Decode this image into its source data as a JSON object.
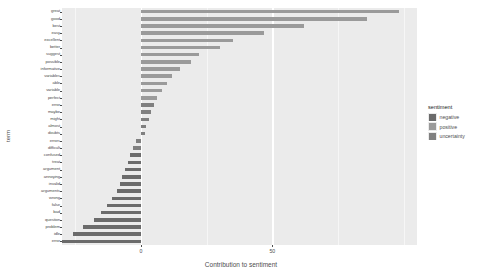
{
  "chart_data": {
    "type": "bar",
    "orientation": "horizontal",
    "title": "",
    "xlabel": "Contribution to sentiment",
    "ylabel": "term",
    "xlim": [
      -30,
      105
    ],
    "xticks": [
      0,
      50
    ],
    "xticklabels": [
      "0",
      "50"
    ],
    "grid": true,
    "legend": {
      "title": "sentiment",
      "position": "right",
      "entries": [
        {
          "label": "negative",
          "color": "#6b6b6b"
        },
        {
          "label": "positive",
          "color": "#9a9a9a"
        },
        {
          "label": "uncertainty",
          "color": "#808080"
        }
      ]
    },
    "categories": [
      "great",
      "good",
      "best",
      "easy",
      "excellent",
      "better",
      "suggest",
      "possible",
      "informative",
      "variables",
      "able",
      "variable",
      "perfect",
      "error",
      "maybe",
      "might",
      "almost",
      "doubts",
      "errors",
      "difficult",
      "confused",
      "treat",
      "argument",
      "annoying",
      "invalid",
      "arguments",
      "wrong",
      "false",
      "bad",
      "question",
      "problem",
      "idle",
      "error "
    ],
    "values": [
      98,
      86,
      62,
      47,
      35,
      30,
      22,
      19,
      15,
      12,
      10,
      8,
      6,
      5,
      4,
      3,
      2,
      1.5,
      -2,
      -3,
      -4,
      -5,
      -6,
      -7,
      -8,
      -9,
      -11,
      -13,
      -15,
      -18,
      -22,
      -26,
      -32
    ],
    "series": [
      {
        "name": "positive",
        "color": "#9a9a9a",
        "points": [
          {
            "term": "great",
            "value": 98
          },
          {
            "term": "good",
            "value": 86
          },
          {
            "term": "best",
            "value": 62
          },
          {
            "term": "easy",
            "value": 47
          },
          {
            "term": "excellent",
            "value": 35
          },
          {
            "term": "better",
            "value": 30
          },
          {
            "term": "suggest",
            "value": 22
          },
          {
            "term": "possible",
            "value": 19
          },
          {
            "term": "informative",
            "value": 15
          },
          {
            "term": "variables",
            "value": 12
          },
          {
            "term": "able",
            "value": 10
          },
          {
            "term": "variable",
            "value": 8
          },
          {
            "term": "perfect",
            "value": 6
          }
        ]
      },
      {
        "name": "uncertainty",
        "color": "#808080",
        "points": [
          {
            "term": "error",
            "value": 5
          },
          {
            "term": "maybe",
            "value": 4
          },
          {
            "term": "might",
            "value": 3
          },
          {
            "term": "almost",
            "value": 2
          },
          {
            "term": "doubts",
            "value": 1.5
          },
          {
            "term": "errors",
            "value": -2
          },
          {
            "term": "difficult",
            "value": -3
          }
        ]
      },
      {
        "name": "negative",
        "color": "#6b6b6b",
        "points": [
          {
            "term": "confused",
            "value": -4
          },
          {
            "term": "treat",
            "value": -5
          },
          {
            "term": "argument",
            "value": -6
          },
          {
            "term": "annoying",
            "value": -7
          },
          {
            "term": "invalid",
            "value": -8
          },
          {
            "term": "arguments",
            "value": -9
          },
          {
            "term": "wrong",
            "value": -11
          },
          {
            "term": "false",
            "value": -13
          },
          {
            "term": "bad",
            "value": -15
          },
          {
            "term": "question",
            "value": -18
          },
          {
            "term": "problem",
            "value": -22
          },
          {
            "term": "idle",
            "value": -26
          },
          {
            "term": "error ",
            "value": -32
          }
        ]
      }
    ],
    "bar_groups": [
      {
        "term": "great",
        "value": 98,
        "sentiment": "positive"
      },
      {
        "term": "good",
        "value": 86,
        "sentiment": "positive"
      },
      {
        "term": "best",
        "value": 62,
        "sentiment": "positive"
      },
      {
        "term": "easy",
        "value": 47,
        "sentiment": "positive"
      },
      {
        "term": "excellent",
        "value": 35,
        "sentiment": "positive"
      },
      {
        "term": "better",
        "value": 30,
        "sentiment": "positive"
      },
      {
        "term": "suggest",
        "value": 22,
        "sentiment": "positive"
      },
      {
        "term": "possible",
        "value": 19,
        "sentiment": "positive"
      },
      {
        "term": "informative",
        "value": 15,
        "sentiment": "positive"
      },
      {
        "term": "variables",
        "value": 12,
        "sentiment": "positive"
      },
      {
        "term": "able",
        "value": 10,
        "sentiment": "positive"
      },
      {
        "term": "variable",
        "value": 8,
        "sentiment": "positive"
      },
      {
        "term": "perfect",
        "value": 6,
        "sentiment": "positive"
      },
      {
        "term": "error",
        "value": 5,
        "sentiment": "uncertainty"
      },
      {
        "term": "maybe",
        "value": 4,
        "sentiment": "uncertainty"
      },
      {
        "term": "might",
        "value": 3,
        "sentiment": "uncertainty"
      },
      {
        "term": "almost",
        "value": 2,
        "sentiment": "uncertainty"
      },
      {
        "term": "doubts",
        "value": 1.5,
        "sentiment": "uncertainty"
      },
      {
        "term": "errors",
        "value": -2,
        "sentiment": "uncertainty"
      },
      {
        "term": "difficult",
        "value": -3,
        "sentiment": "uncertainty"
      },
      {
        "term": "confused",
        "value": -4,
        "sentiment": "negative"
      },
      {
        "term": "treat",
        "value": -5,
        "sentiment": "negative"
      },
      {
        "term": "argument",
        "value": -6,
        "sentiment": "negative"
      },
      {
        "term": "annoying",
        "value": -7,
        "sentiment": "negative"
      },
      {
        "term": "invalid",
        "value": -8,
        "sentiment": "negative"
      },
      {
        "term": "arguments",
        "value": -9,
        "sentiment": "negative"
      },
      {
        "term": "wrong",
        "value": -11,
        "sentiment": "negative"
      },
      {
        "term": "false",
        "value": -13,
        "sentiment": "negative"
      },
      {
        "term": "bad",
        "value": -15,
        "sentiment": "negative"
      },
      {
        "term": "question",
        "value": -18,
        "sentiment": "negative"
      },
      {
        "term": "problem",
        "value": -22,
        "sentiment": "negative"
      },
      {
        "term": "idle",
        "value": -26,
        "sentiment": "negative"
      },
      {
        "term": "error ",
        "value": -32,
        "sentiment": "negative"
      }
    ]
  },
  "panel": {
    "background": "#ebebeb",
    "gridline_color": "#ffffff"
  }
}
